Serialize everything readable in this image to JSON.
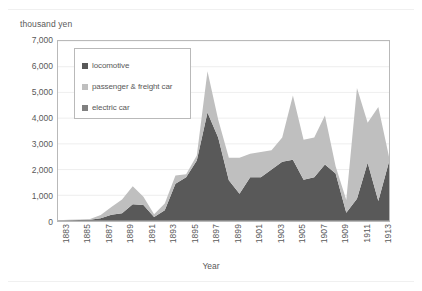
{
  "axes": {
    "y_unit_label": "thousand yen",
    "x_title": "Year",
    "y_ticks": [
      "7,000",
      "6,000",
      "5,000",
      "4,000",
      "3,000",
      "2,000",
      "1,000",
      "0"
    ]
  },
  "legend": {
    "items": [
      {
        "label": "locomotive",
        "color": "#595959"
      },
      {
        "label": "passenger & freight car",
        "color": "#bfbfbf"
      },
      {
        "label": "electric car",
        "color": "#808080"
      }
    ]
  },
  "chart_data": {
    "type": "area",
    "stacked": true,
    "title": "",
    "subtitle": "",
    "xlabel": "Year",
    "ylabel": "thousand yen",
    "xlim": [
      1883,
      1914
    ],
    "ylim": [
      0,
      7000
    ],
    "ytick_step": 1000,
    "grid": "horizontal",
    "legend_position": "inside-top-left",
    "xtick_labels": [
      "1883",
      "1885",
      "1887",
      "1889",
      "1891",
      "1893",
      "1895",
      "1897",
      "1899",
      "1901",
      "1903",
      "1905",
      "1907",
      "1909",
      "1911",
      "1913"
    ],
    "xtick_step": 2,
    "x": [
      1883,
      1884,
      1885,
      1886,
      1887,
      1888,
      1889,
      1890,
      1891,
      1892,
      1893,
      1894,
      1895,
      1896,
      1897,
      1898,
      1899,
      1900,
      1901,
      1902,
      1903,
      1904,
      1905,
      1906,
      1907,
      1908,
      1909,
      1910,
      1911,
      1912,
      1913,
      1914
    ],
    "series": [
      {
        "name": "locomotive",
        "color": "#595959",
        "values": [
          20,
          30,
          40,
          50,
          110,
          240,
          300,
          650,
          620,
          160,
          420,
          1450,
          1700,
          2350,
          4220,
          3250,
          1580,
          1060,
          1700,
          1700,
          2000,
          2300,
          2380,
          1600,
          1700,
          2200,
          1850,
          320,
          870,
          2270,
          780,
          2300
        ]
      },
      {
        "name": "passenger & freight car",
        "color": "#bfbfbf",
        "values": [
          10,
          15,
          20,
          25,
          120,
          300,
          540,
          700,
          320,
          100,
          260,
          320,
          120,
          200,
          1600,
          700,
          880,
          1400,
          920,
          980,
          750,
          950,
          2500,
          1560,
          1550,
          1900,
          280,
          500,
          4300,
          1550,
          3650,
          200
        ]
      },
      {
        "name": "electric car",
        "color": "#808080",
        "values": [
          0,
          0,
          0,
          0,
          0,
          0,
          0,
          0,
          0,
          0,
          0,
          0,
          0,
          0,
          0,
          0,
          0,
          0,
          0,
          0,
          0,
          0,
          0,
          0,
          0,
          0,
          0,
          0,
          0,
          0,
          0,
          0
        ]
      }
    ],
    "totals": [
      30,
      45,
      60,
      75,
      230,
      540,
      840,
      1350,
      940,
      260,
      680,
      1770,
      1820,
      2550,
      5820,
      3950,
      2460,
      2460,
      2620,
      2680,
      2750,
      3250,
      4880,
      3160,
      3250,
      4100,
      2130,
      820,
      5170,
      3820,
      4430,
      2500
    ]
  }
}
